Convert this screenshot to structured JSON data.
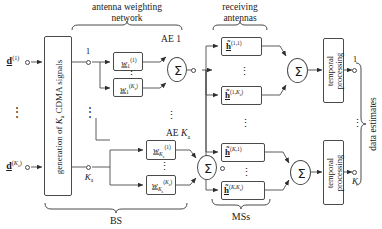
{
  "diagram": {
    "group_labels": {
      "antenna_weighting_network_line1": "antenna weighting",
      "antenna_weighting_network_line2": "network",
      "receiving_antennas_line1": "receiving",
      "receiving_antennas_line2": "antennas",
      "bs": "BS",
      "mss": "MSs",
      "data_estimates": "data estimates"
    },
    "inputs": [
      {
        "name": "input-d-1",
        "base": "d",
        "sup": "(1)",
        "sub": ""
      },
      {
        "name": "input-d-Ka",
        "base": "d",
        "sup": "(K",
        "sup2": "a",
        "sup3": ")",
        "full": "d(Ka)"
      }
    ],
    "generator_block": {
      "label_pre": "generation of ",
      "label_K": "K",
      "label_sub": "a",
      "label_post": " CDMA signals"
    },
    "branch_labels": {
      "top": "1",
      "bottom_base": "K",
      "bottom_sub": "a"
    },
    "antenna_elements": [
      {
        "name": "ae-1",
        "label_pre": "AE ",
        "label_val": "1"
      },
      {
        "name": "ae-Ka",
        "label_pre": "AE ",
        "label_val": "K",
        "label_sub": "a"
      }
    ],
    "weight_boxes": [
      {
        "name": "weight-w-1-1",
        "base": "w",
        "sup": "(1)",
        "sub": "1"
      },
      {
        "name": "weight-w-1-Ka",
        "base": "w",
        "sup": "(Ka)",
        "sub": "1"
      },
      {
        "name": "weight-w-Ka-1",
        "base": "w",
        "sup": "(1)",
        "sub": "Ka"
      },
      {
        "name": "weight-w-Ka-Ka",
        "base": "w",
        "sup": "(Ka)",
        "sub": "Ka"
      }
    ],
    "channel_boxes": [
      {
        "name": "channel-h-1-1",
        "base": "h",
        "sup": "(1,1)"
      },
      {
        "name": "channel-h-1-Ka",
        "base": "h",
        "sup": "(1,Ka)"
      },
      {
        "name": "channel-h-K-1",
        "base": "h",
        "sup": "(K,1)"
      },
      {
        "name": "channel-h-K-Ka",
        "base": "h",
        "sup": "(K,Ka)"
      }
    ],
    "temporal_blocks": [
      {
        "name": "temporal-processing-1",
        "line1": "temporal",
        "line2": "processing",
        "output_label": "1"
      },
      {
        "name": "temporal-processing-K",
        "line1": "temporal",
        "line2": "processing",
        "output_label": "K"
      }
    ],
    "summation_symbol": "Σ",
    "vertical_dots": "⋮",
    "colors": {
      "stroke": "#4a4a4a",
      "text": "#1a1a1a",
      "background": "#ffffff"
    }
  }
}
